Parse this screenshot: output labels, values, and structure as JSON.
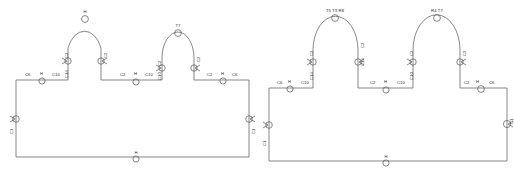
{
  "diagram": {
    "type": "engineering-line-drawing",
    "line_color": "#555555",
    "text_color": "#2b2b2b",
    "background": "#ffffff",
    "panel_count": 2
  },
  "panels": [
    {
      "id": "panel-left",
      "name": "left-loop",
      "arches": [
        {
          "id": "arch-1",
          "crown_labels": "H",
          "left_leg_labels": [
            "C2",
            "C14"
          ],
          "right_leg_labels": [
            "C2",
            "C14"
          ],
          "left_marker": "arrow-valve-marker",
          "right_marker": "arrow-valve-marker",
          "crown_marker": "instrument-bubble"
        },
        {
          "id": "arch-2",
          "crown_labels": "T7",
          "left_leg_labels": [
            "C2",
            "C10"
          ],
          "right_leg_labels": [
            "C2",
            "C14"
          ],
          "left_marker": "arrow-valve-marker",
          "right_marker": "arrow-valve-marker",
          "crown_marker": "instrument-bubble"
        }
      ],
      "baseline_labels": [
        {
          "text": "C6",
          "x": 25,
          "y": 73
        },
        {
          "text": "H",
          "x": 39,
          "y": 72
        },
        {
          "text": "C10",
          "x": 52,
          "y": 73
        },
        {
          "text": "C2",
          "x": 122,
          "y": 73
        },
        {
          "text": "H",
          "x": 134,
          "y": 72
        },
        {
          "text": "C10",
          "x": 147,
          "y": 73
        },
        {
          "text": "C2",
          "x": 208,
          "y": 73
        },
        {
          "text": "H",
          "x": 221,
          "y": 72
        },
        {
          "text": "C6",
          "x": 233,
          "y": 73
        }
      ],
      "edge_labels": [
        {
          "text": "C1",
          "x": 6,
          "y": 128
        },
        {
          "text": "C1",
          "x": 250,
          "y": 120
        }
      ],
      "bottom_label": {
        "text": "H",
        "x": 133,
        "y": 152
      },
      "markers": {
        "left_edge": "instrument-bubble-arrow",
        "right_edge": "instrument-bubble-arrow",
        "bottom": "instrument-bubble"
      }
    },
    {
      "id": "panel-right",
      "name": "right-loop",
      "arches": [
        {
          "id": "arch-1",
          "crown_labels": "T5  T3  R8",
          "left_leg_labels": [
            "C2",
            "C14"
          ],
          "right_leg_labels": [
            "C2",
            "C14"
          ],
          "left_marker": "arrow-valve-marker",
          "right_marker": "arrow-valve-marker",
          "crown_marker": "instrument-bubble"
        },
        {
          "id": "arch-2",
          "crown_labels": "R4  T7",
          "left_leg_labels": [
            "C2",
            "C10"
          ],
          "right_leg_labels": [
            "C2",
            "C14"
          ],
          "left_marker": "arrow-valve-marker",
          "right_marker": "arrow-valve-marker",
          "crown_marker": "instrument-bubble"
        }
      ],
      "baseline_labels": [
        {
          "text": "C6",
          "x": 22,
          "y": 85
        },
        {
          "text": "H",
          "x": 32,
          "y": 84
        },
        {
          "text": "C10",
          "x": 48,
          "y": 85
        },
        {
          "text": "C2",
          "x": 118,
          "y": 85
        },
        {
          "text": "H",
          "x": 129,
          "y": 84
        },
        {
          "text": "C10",
          "x": 144,
          "y": 85
        },
        {
          "text": "C2",
          "x": 212,
          "y": 85
        },
        {
          "text": "H",
          "x": 223,
          "y": 84
        },
        {
          "text": "C6",
          "x": 234,
          "y": 85
        }
      ],
      "edge_labels": [
        {
          "text": "C1",
          "x": 6,
          "y": 140
        },
        {
          "text": "C1",
          "x": 247,
          "y": 112
        }
      ],
      "bottom_label": {
        "text": "H",
        "x": 128,
        "y": 158
      },
      "markers": {
        "left_edge": "instrument-bubble-arrow",
        "right_edge": "instrument-bubble-arrow",
        "bottom": "instrument-bubble"
      }
    }
  ],
  "leg_labels_left_panel": [
    {
      "text": "C2",
      "x": 62,
      "y": 44
    },
    {
      "text": "C14",
      "x": 62,
      "y": 66
    },
    {
      "text": "C2",
      "x": 108,
      "y": 48
    },
    {
      "text": "C14",
      "x": 108,
      "y": 66
    },
    {
      "text": "C2",
      "x": 155,
      "y": 52
    },
    {
      "text": "C10",
      "x": 155,
      "y": 70
    },
    {
      "text": "C2",
      "x": 200,
      "y": 50
    },
    {
      "text": "C14",
      "x": 200,
      "y": 68
    }
  ],
  "leg_labels_right_panel": [
    {
      "text": "C2",
      "x": 308,
      "y": 52
    },
    {
      "text": "C14",
      "x": 308,
      "y": 74
    },
    {
      "text": "C2",
      "x": 358,
      "y": 46
    },
    {
      "text": "C14",
      "x": 358,
      "y": 62
    },
    {
      "text": "C2",
      "x": 358,
      "y": 78
    },
    {
      "text": "C2",
      "x": 410,
      "y": 52
    },
    {
      "text": "C10",
      "x": 410,
      "y": 74
    },
    {
      "text": "C2",
      "x": 460,
      "y": 52
    }
  ]
}
